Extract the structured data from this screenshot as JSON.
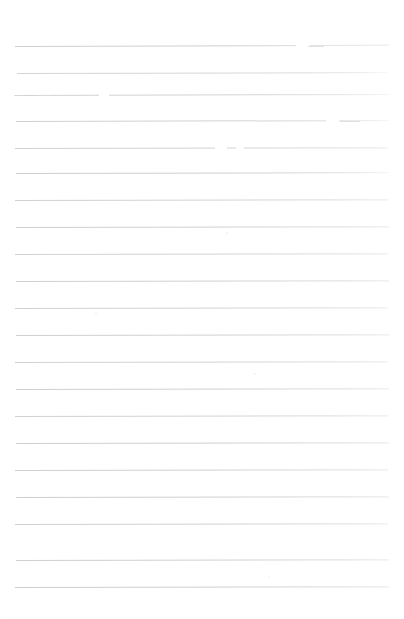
{
  "document": {
    "kind": "blank-ruled-paper-scan",
    "title": "Blank lined page",
    "page_width": 404,
    "page_height": 619,
    "background_color": "#ffffff",
    "text_content": "",
    "notes": "No text, headings, labels or UI controls are present on this page."
  },
  "ruling": {
    "line_color": "#c9ccd0",
    "line_thickness_px": 1,
    "line_count": 21,
    "spacing_px": 27,
    "left_margin_px": 15,
    "right_edge_px": 389,
    "first_line_y_px": 46,
    "last_line_y_px": 587,
    "lines": [
      {
        "y": 46,
        "x_start": 15,
        "x_end": 389,
        "tilt_deg": -0.18,
        "opacity": 0.92
      },
      {
        "y": 73,
        "x_start": 17,
        "x_end": 387,
        "tilt_deg": -0.14,
        "opacity": 0.8
      },
      {
        "y": 95,
        "x_start": 15,
        "x_end": 390,
        "tilt_deg": -0.16,
        "opacity": 0.88
      },
      {
        "y": 121,
        "x_start": 16,
        "x_end": 389,
        "tilt_deg": -0.15,
        "opacity": 0.9
      },
      {
        "y": 148,
        "x_start": 15,
        "x_end": 388,
        "tilt_deg": -0.13,
        "opacity": 0.86
      },
      {
        "y": 173,
        "x_start": 16,
        "x_end": 389,
        "tilt_deg": -0.14,
        "opacity": 0.92
      },
      {
        "y": 200,
        "x_start": 15,
        "x_end": 388,
        "tilt_deg": -0.12,
        "opacity": 0.88
      },
      {
        "y": 227,
        "x_start": 16,
        "x_end": 389,
        "tilt_deg": -0.13,
        "opacity": 0.9
      },
      {
        "y": 254,
        "x_start": 15,
        "x_end": 388,
        "tilt_deg": -0.12,
        "opacity": 0.86
      },
      {
        "y": 281,
        "x_start": 16,
        "x_end": 389,
        "tilt_deg": -0.13,
        "opacity": 0.9
      },
      {
        "y": 308,
        "x_start": 15,
        "x_end": 388,
        "tilt_deg": -0.12,
        "opacity": 0.88
      },
      {
        "y": 335,
        "x_start": 16,
        "x_end": 389,
        "tilt_deg": -0.12,
        "opacity": 0.9
      },
      {
        "y": 362,
        "x_start": 15,
        "x_end": 388,
        "tilt_deg": -0.11,
        "opacity": 0.86
      },
      {
        "y": 389,
        "x_start": 16,
        "x_end": 389,
        "tilt_deg": -0.12,
        "opacity": 0.9
      },
      {
        "y": 416,
        "x_start": 15,
        "x_end": 388,
        "tilt_deg": -0.11,
        "opacity": 0.88
      },
      {
        "y": 443,
        "x_start": 16,
        "x_end": 389,
        "tilt_deg": -0.12,
        "opacity": 0.92
      },
      {
        "y": 470,
        "x_start": 15,
        "x_end": 388,
        "tilt_deg": -0.11,
        "opacity": 0.9
      },
      {
        "y": 497,
        "x_start": 16,
        "x_end": 389,
        "tilt_deg": -0.11,
        "opacity": 0.92
      },
      {
        "y": 524,
        "x_start": 15,
        "x_end": 388,
        "tilt_deg": -0.1,
        "opacity": 0.9
      },
      {
        "y": 560,
        "x_start": 16,
        "x_end": 389,
        "tilt_deg": -0.11,
        "opacity": 0.92
      },
      {
        "y": 587,
        "x_start": 15,
        "x_end": 389,
        "tilt_deg": -0.1,
        "opacity": 0.94
      }
    ]
  },
  "artifacts": {
    "breaks": [
      {
        "x": 296,
        "y": 45,
        "width": 14
      },
      {
        "x": 215,
        "y": 147,
        "width": 12
      },
      {
        "x": 326,
        "y": 120,
        "width": 13
      },
      {
        "x": 99,
        "y": 94,
        "width": 10
      },
      {
        "x": 236,
        "y": 147,
        "width": 8
      }
    ],
    "stray_marks": [
      {
        "x": 14,
        "y": 95,
        "width": 9
      },
      {
        "x": 38,
        "y": 95,
        "width": 14
      },
      {
        "x": 340,
        "y": 121,
        "width": 20
      },
      {
        "x": 308,
        "y": 46,
        "width": 16
      }
    ],
    "specks": [
      {
        "x": 226,
        "y": 232,
        "size": 2,
        "opacity": 0.55
      },
      {
        "x": 95,
        "y": 312,
        "size": 2,
        "opacity": 0.5
      },
      {
        "x": 254,
        "y": 373,
        "size": 2,
        "opacity": 0.5
      },
      {
        "x": 122,
        "y": 113,
        "size": 1,
        "opacity": 0.45
      },
      {
        "x": 362,
        "y": 238,
        "size": 1,
        "opacity": 0.4
      },
      {
        "x": 268,
        "y": 576,
        "size": 2,
        "opacity": 0.4
      }
    ]
  }
}
